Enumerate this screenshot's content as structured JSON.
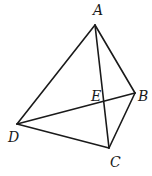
{
  "diagram": {
    "type": "geometry-quadrilateral",
    "stroke_color": "#1a1a1a",
    "background": "#ffffff",
    "points": {
      "A": {
        "label": "A",
        "x": 95,
        "y": 25,
        "lx": 93,
        "ly": 15
      },
      "B": {
        "label": "B",
        "x": 135,
        "y": 93,
        "lx": 138,
        "ly": 101
      },
      "C": {
        "label": "C",
        "x": 109,
        "y": 148,
        "lx": 110,
        "ly": 167
      },
      "D": {
        "label": "D",
        "x": 17,
        "y": 124,
        "lx": 8,
        "ly": 142
      },
      "E": {
        "label": "E",
        "x": 104,
        "y": 101,
        "lx": 91,
        "ly": 101
      }
    },
    "segments": [
      [
        "A",
        "D"
      ],
      [
        "A",
        "B"
      ],
      [
        "A",
        "C"
      ],
      [
        "B",
        "C"
      ],
      [
        "D",
        "C"
      ],
      [
        "D",
        "B"
      ]
    ]
  }
}
